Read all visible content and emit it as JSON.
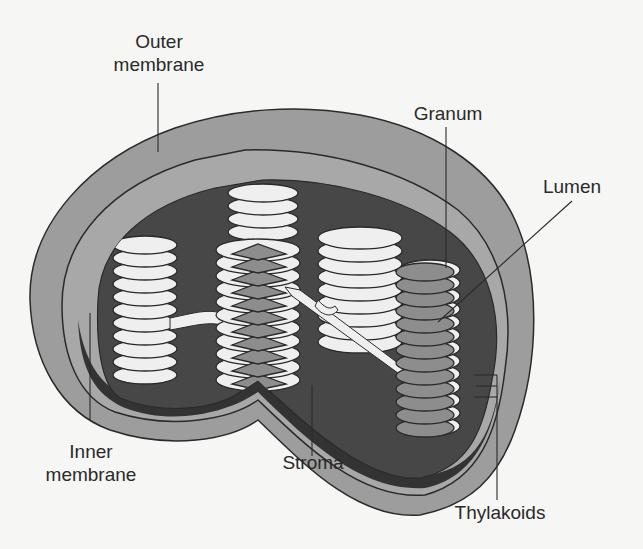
{
  "diagram": {
    "colors": {
      "background": "#f6f6f4",
      "outer_membrane": "#9d9d9d",
      "inner_membrane": "#a8a8a8",
      "stroma": "#474747",
      "stroma_floor": "#3a3a3a",
      "thylakoid_light": "#efefef",
      "thylakoid_dark": "#8d8d8d",
      "outline": "#2a2a2a"
    },
    "labels": {
      "outer_membrane_line1": "Outer",
      "outer_membrane_line2": "membrane",
      "granum": "Granum",
      "lumen": "Lumen",
      "inner_membrane_line1": "Inner",
      "inner_membrane_line2": "membrane",
      "stroma": "Stroma",
      "thylakoids": "Thylakoids"
    }
  }
}
